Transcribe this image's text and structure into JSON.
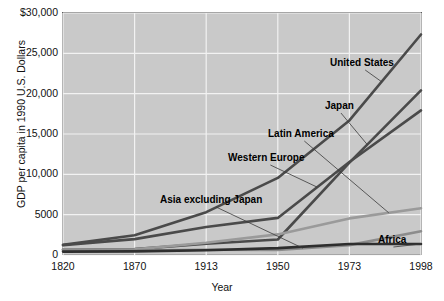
{
  "chart_data": {
    "type": "line",
    "title": "",
    "xlabel": "Year",
    "ylabel": "GDP per capita in 1990 U.S. Dollars",
    "categories": [
      "1820",
      "1870",
      "1913",
      "1950",
      "1973",
      "1998"
    ],
    "yticks": [
      "0",
      "5000",
      "10,000",
      "15,000",
      "20,000",
      "25,000",
      "$30,000"
    ],
    "ylim": [
      0,
      30000
    ],
    "grid": true,
    "legend_position": "inline-annotations",
    "series": [
      {
        "name": "United States",
        "values": [
          1257,
          2445,
          5301,
          9561,
          16689,
          27331
        ],
        "color": "#4a4a4a"
      },
      {
        "name": "Western Europe",
        "values": [
          1232,
          1974,
          3473,
          4594,
          11534,
          17921
        ],
        "color": "#4a4a4a"
      },
      {
        "name": "Japan",
        "values": [
          669,
          737,
          1387,
          1926,
          11439,
          20413
        ],
        "color": "#4a4a4a"
      },
      {
        "name": "Latin America",
        "values": [
          665,
          698,
          1511,
          2554,
          4531,
          5795
        ],
        "color": "#9a9a9a"
      },
      {
        "name": "Asia excluding Japan",
        "values": [
          575,
          543,
          640,
          635,
          1231,
          2936
        ],
        "color": "#8c8c8c"
      },
      {
        "name": "Africa",
        "values": [
          418,
          444,
          585,
          852,
          1365,
          1368
        ],
        "color": "#2e2e2e"
      }
    ]
  },
  "annotations": [
    {
      "label": "United States",
      "x": 330,
      "y": 57
    },
    {
      "label": "Japan",
      "x": 325,
      "y": 100
    },
    {
      "label": "Latin America",
      "x": 268,
      "y": 128
    },
    {
      "label": "Western Europe",
      "x": 228,
      "y": 152
    },
    {
      "label": "Asia excluding Japan",
      "x": 160,
      "y": 194
    },
    {
      "label": "Africa",
      "x": 378,
      "y": 234
    }
  ]
}
